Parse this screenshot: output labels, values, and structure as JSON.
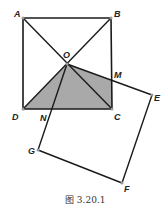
{
  "figure": {
    "caption": "图 3.20.1",
    "colors": {
      "stroke": "#1a1a1a",
      "shade": "#a9a9a9",
      "vertex": "#999999"
    },
    "labels": {
      "A": "A",
      "B": "B",
      "C": "C",
      "D": "D",
      "O": "O",
      "M": "M",
      "N": "N",
      "E": "E",
      "F": "F",
      "G": "G"
    }
  }
}
